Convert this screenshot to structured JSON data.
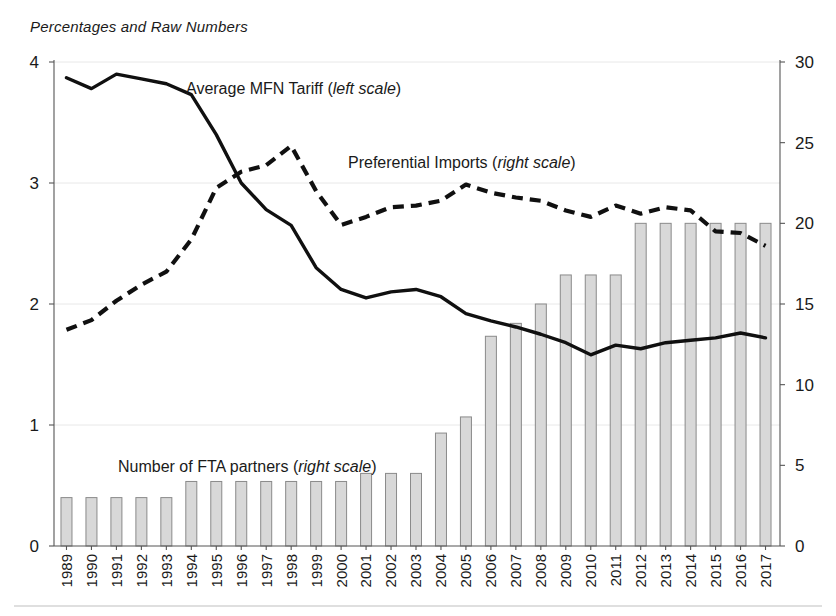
{
  "figure": {
    "subtitle": "Percentages and Raw Numbers"
  },
  "axes": {
    "left_ticks": [
      "0",
      "1",
      "2",
      "3",
      "4"
    ],
    "right_ticks": [
      "0",
      "5",
      "10",
      "15",
      "20",
      "25",
      "30"
    ]
  },
  "series_labels": {
    "mfn": {
      "text": "Average MFN Tariff (",
      "em": "left scale",
      "tail": ")"
    },
    "preferential": {
      "text": "Preferential Imports (",
      "em": "right scale",
      "tail": ")"
    },
    "fta": {
      "text": "Number of FTA partners (",
      "em": "right scale",
      "tail": ")"
    }
  },
  "colors": {
    "bar_fill": "#d8d8d8",
    "bar_stroke": "#8a8a8a",
    "line": "#101010",
    "grid": "#e8e8e8"
  },
  "chart_data": {
    "type": "bar",
    "title": "",
    "subtitle": "Percentages and Raw Numbers",
    "xlabel": "",
    "ylabel": "",
    "grid": true,
    "legend": "inline-annotations",
    "categories": [
      "1989",
      "1990",
      "1991",
      "1992",
      "1993",
      "1994",
      "1995",
      "1996",
      "1997",
      "1998",
      "1999",
      "2000",
      "2001",
      "2002",
      "2003",
      "2004",
      "2005",
      "2006",
      "2007",
      "2008",
      "2009",
      "2010",
      "2011",
      "2012",
      "2013",
      "2014",
      "2015",
      "2016",
      "2017"
    ],
    "left_axis": {
      "label": "Percent",
      "ylim": [
        0,
        4
      ],
      "ticks": [
        0,
        1,
        2,
        3,
        4
      ]
    },
    "right_axis": {
      "label": "Number / Percent",
      "ylim": [
        0,
        30
      ],
      "ticks": [
        0,
        5,
        10,
        15,
        20,
        25,
        30
      ]
    },
    "series": [
      {
        "name": "Number of FTA partners (right scale)",
        "type": "bar",
        "axis": "right",
        "values": [
          3,
          3,
          3,
          3,
          3,
          4,
          4,
          4,
          4,
          4,
          4,
          4,
          4.5,
          4.5,
          4.5,
          7,
          8,
          13,
          13.8,
          15,
          16.8,
          16.8,
          16.8,
          20,
          20,
          20,
          20,
          20,
          20
        ]
      },
      {
        "name": "Average MFN Tariff (left scale)",
        "type": "line",
        "axis": "left",
        "style": "solid",
        "values": [
          3.87,
          3.78,
          3.9,
          3.86,
          3.82,
          3.73,
          3.4,
          3.0,
          2.78,
          2.65,
          2.3,
          2.12,
          2.05,
          2.1,
          2.12,
          2.06,
          1.92,
          1.86,
          1.81,
          1.75,
          1.68,
          1.58,
          1.66,
          1.63,
          1.68,
          1.7,
          1.72,
          1.76,
          1.72
        ]
      },
      {
        "name": "Preferential Imports (right scale)",
        "type": "line",
        "axis": "right",
        "style": "dashed",
        "values": [
          13.4,
          14.0,
          15.2,
          16.2,
          17.0,
          19.0,
          22.2,
          23.2,
          23.6,
          24.8,
          22.0,
          19.9,
          20.4,
          21.0,
          21.1,
          21.4,
          22.4,
          21.9,
          21.6,
          21.4,
          20.8,
          20.4,
          21.1,
          20.6,
          21.0,
          20.8,
          19.5,
          19.4,
          18.6
        ]
      }
    ]
  }
}
